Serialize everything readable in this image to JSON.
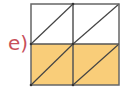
{
  "label": "e)",
  "colors": {
    "label": "#c8505a",
    "fill": "#f9cd79",
    "empty": "#ffffff",
    "line": "#555555",
    "diagonal": "#444444"
  },
  "grid": {
    "rows": 2,
    "cols": 2,
    "cells": [
      {
        "row": 0,
        "col": 0,
        "shaded": false,
        "diagonal": "bottom-left-to-top-right"
      },
      {
        "row": 0,
        "col": 1,
        "shaded": false,
        "diagonal": "bottom-left-to-top-right"
      },
      {
        "row": 1,
        "col": 0,
        "shaded": true,
        "diagonal": "bottom-left-to-top-right"
      },
      {
        "row": 1,
        "col": 1,
        "shaded": true,
        "diagonal": "bottom-left-to-top-right"
      }
    ]
  }
}
